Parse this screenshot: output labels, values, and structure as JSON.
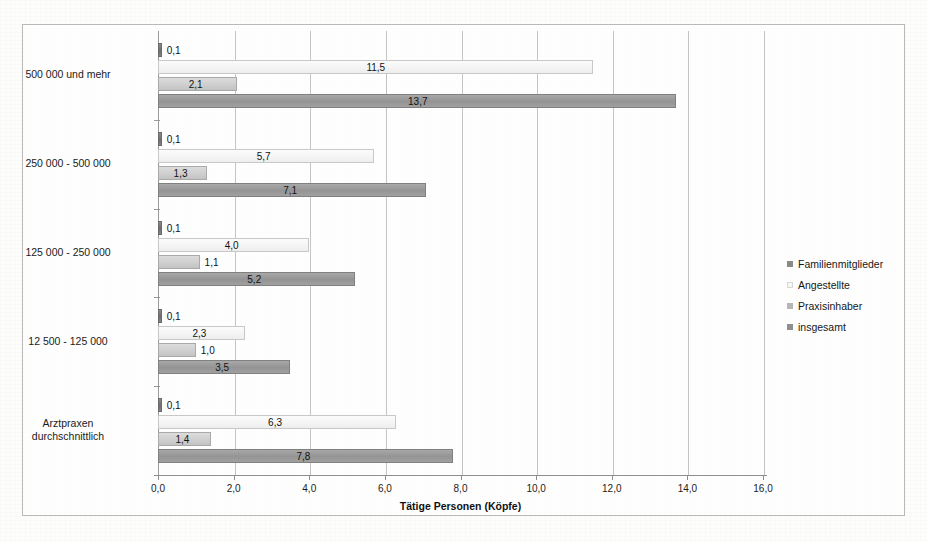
{
  "chart_data": {
    "type": "bar",
    "orientation": "horizontal",
    "title": "",
    "xlabel": "Tätige Personen (Köpfe)",
    "ylabel": "",
    "xlim": [
      0.0,
      16.0
    ],
    "xticks": [
      "0,0",
      "2,0",
      "4,0",
      "6,0",
      "8,0",
      "10,0",
      "12,0",
      "14,0",
      "16,0"
    ],
    "xtick_values": [
      0,
      2,
      4,
      6,
      8,
      10,
      12,
      14,
      16
    ],
    "grid": "vertical",
    "legend_position": "right",
    "categories": [
      "500 000 und mehr",
      "250 000 - 500 000",
      "125 000 - 250 000",
      "12 500 -  125 000",
      "Arztpraxen durchschnittlich"
    ],
    "series": [
      {
        "name": "Familienmitglieder",
        "color": "#7c7c7c",
        "values": [
          0.1,
          0.1,
          0.1,
          0.1,
          0.1
        ],
        "labels": [
          "0,1",
          "0,1",
          "0,1",
          "0,1",
          "0,1"
        ]
      },
      {
        "name": "Angestellte",
        "color": "#f5f5f5",
        "values": [
          11.5,
          5.7,
          4.0,
          2.3,
          6.3
        ],
        "labels": [
          "11,5",
          "5,7",
          "4,0",
          "2,3",
          "6,3"
        ]
      },
      {
        "name": "Praxisinhaber",
        "color": "#cfcfcf",
        "values": [
          2.1,
          1.3,
          1.1,
          1.0,
          1.4
        ],
        "labels": [
          "2,1",
          "1,3",
          "1,1",
          "1,0",
          "1,4"
        ]
      },
      {
        "name": "insgesamt",
        "color": "#9a9a9a",
        "values": [
          13.7,
          7.1,
          5.2,
          3.5,
          7.8
        ],
        "labels": [
          "13,7",
          "7,1",
          "5,2",
          "3,5",
          "7,8"
        ]
      }
    ]
  },
  "legend": {
    "items": [
      {
        "label": "Familienmitglieder"
      },
      {
        "label": "Angestellte"
      },
      {
        "label": "Praxisinhaber"
      },
      {
        "label": "insgesamt"
      }
    ]
  },
  "axis": {
    "x_title": "Tätige Personen (Köpfe)"
  }
}
